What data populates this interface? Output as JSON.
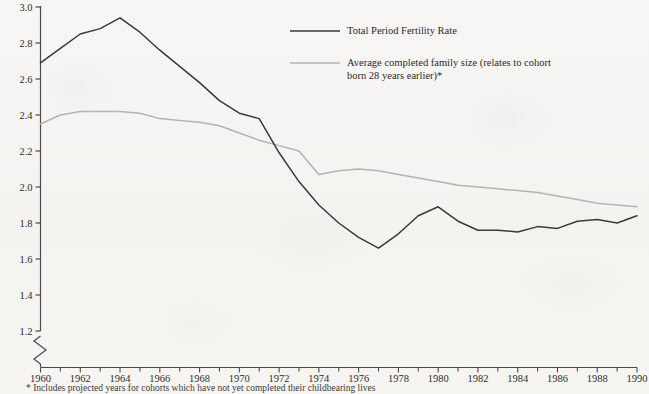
{
  "chart_data": {
    "type": "line",
    "title": "",
    "xlabel": "",
    "ylabel": "",
    "xlim": [
      1960,
      1990
    ],
    "ylim": [
      1.2,
      3.0
    ],
    "ytick_labels": [
      "1.2",
      "1.4",
      "1.6",
      "1.8",
      "2.0",
      "2.2",
      "2.4",
      "2.6",
      "2.8",
      "3.0"
    ],
    "ytick_values": [
      1.2,
      1.4,
      1.6,
      1.8,
      2.0,
      2.2,
      2.4,
      2.6,
      2.8,
      3.0
    ],
    "axis_break": true,
    "axis_break_note": "y-axis broken below 1.2",
    "xtick_labels": [
      "1960",
      "1962",
      "1964",
      "1966",
      "1968",
      "1970",
      "1972",
      "1974",
      "1976",
      "1978",
      "1980",
      "1982",
      "1984",
      "1986",
      "1988",
      "1990"
    ],
    "xtick_values": [
      1960,
      1962,
      1964,
      1966,
      1968,
      1970,
      1972,
      1974,
      1976,
      1978,
      1980,
      1982,
      1984,
      1986,
      1988,
      1990
    ],
    "minor_xticks_every": 1,
    "grid": false,
    "legend_position": "top-center",
    "x": [
      1960,
      1961,
      1962,
      1963,
      1964,
      1965,
      1966,
      1967,
      1968,
      1969,
      1970,
      1971,
      1972,
      1973,
      1974,
      1975,
      1976,
      1977,
      1978,
      1979,
      1980,
      1981,
      1982,
      1983,
      1984,
      1985,
      1986,
      1987,
      1988,
      1989,
      1990
    ],
    "series": [
      {
        "name": "Total Period Fertility Rate",
        "color": "#3a3a3a",
        "values": [
          2.69,
          2.77,
          2.85,
          2.88,
          2.94,
          2.86,
          2.76,
          2.67,
          2.58,
          2.48,
          2.41,
          2.38,
          2.19,
          2.03,
          1.9,
          1.8,
          1.72,
          1.66,
          1.74,
          1.84,
          1.89,
          1.81,
          1.76,
          1.76,
          1.75,
          1.78,
          1.77,
          1.81,
          1.82,
          1.8,
          1.84
        ]
      },
      {
        "name": "Average completed family size (relates to cohort born 28 years earlier)*",
        "color": "#b3b3b3",
        "values": [
          2.35,
          2.4,
          2.42,
          2.42,
          2.42,
          2.41,
          2.38,
          2.37,
          2.36,
          2.34,
          2.3,
          2.26,
          2.23,
          2.2,
          2.07,
          2.09,
          2.1,
          2.09,
          2.07,
          2.05,
          2.03,
          2.01,
          2.0,
          1.99,
          1.98,
          1.97,
          1.95,
          1.93,
          1.91,
          1.9,
          1.89
        ]
      }
    ]
  },
  "legend": {
    "items": [
      {
        "label": "Total Period Fertility Rate",
        "color": "#3a3a3a"
      },
      {
        "label": "Average completed family size (relates to cohort\nborn 28 years earlier)*",
        "color": "#b3b3b3"
      }
    ]
  },
  "footnote": {
    "text": "* Includes projected years for cohorts which have not yet completed their childbearing lives"
  }
}
